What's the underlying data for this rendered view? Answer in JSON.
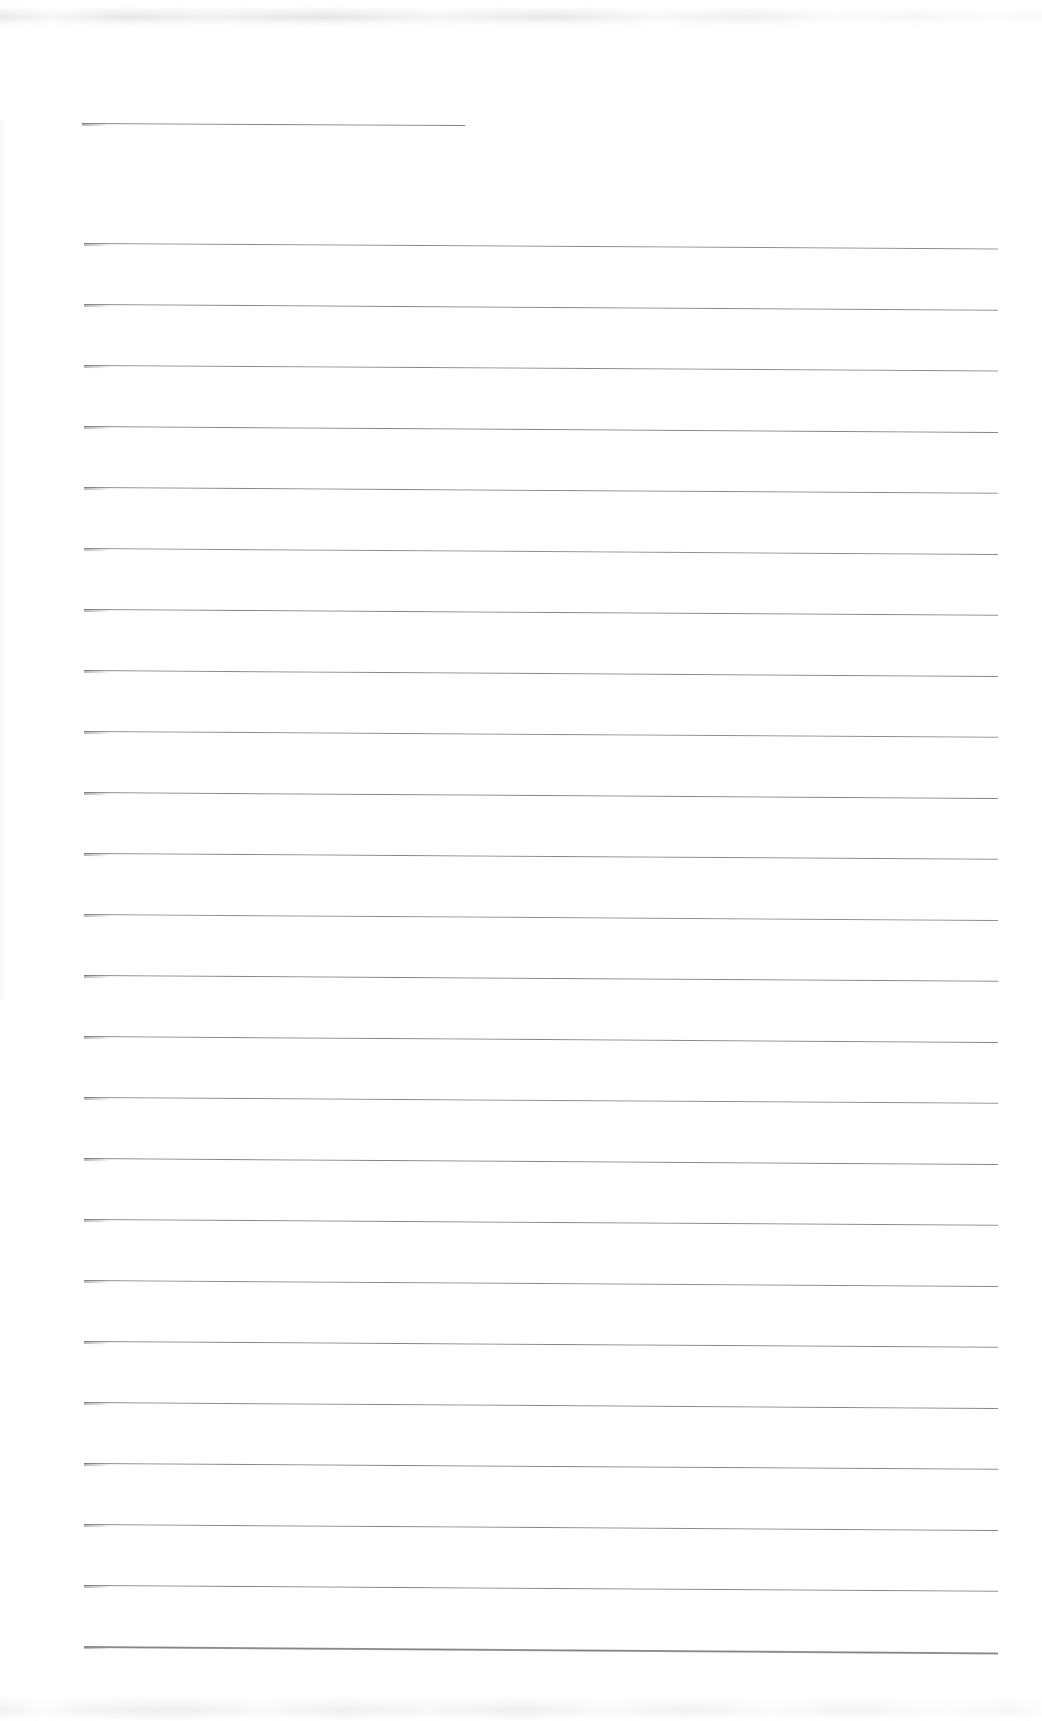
{
  "document": {
    "kind": "scanned-lined-paper",
    "title": "Blank Ruled Notebook Page",
    "page_width": 1042,
    "page_height": 1721,
    "background_color": "#ffffff",
    "rule_color": "#8f9196",
    "content_text": "",
    "handwriting": "",
    "typed_text": "",
    "header_text": "",
    "footer_text": "",
    "page_number": "",
    "notes": "No text, figures, captions, or marks are present on the page; the sheet is entirely blank apart from the printed horizontal ruling lines and faint scanner edge smudges."
  },
  "layout": {
    "rule_left_x": 84,
    "rule_right_x": 998,
    "header_rule_left_x": 82,
    "header_rule_right_x": 465,
    "first_rule_y": 123,
    "body_first_rule_y": 243,
    "body_last_rule_y": 1646,
    "rule_spacing": 61,
    "rule_thickness": 1.4,
    "skew_degrees": 0.38
  },
  "rules": [
    {
      "id": "rule-header",
      "y": 123,
      "x": 82,
      "width": 383,
      "skew": 0.3,
      "weight": 1.4,
      "opacity": 0.95,
      "type": "header"
    },
    {
      "id": "rule-01",
      "y": 243,
      "x": 84,
      "width": 914,
      "skew": 0.34,
      "weight": 1.3,
      "opacity": 0.88,
      "type": "body"
    },
    {
      "id": "rule-02",
      "y": 304,
      "x": 84,
      "width": 914,
      "skew": 0.36,
      "weight": 1.3,
      "opacity": 0.9,
      "type": "body"
    },
    {
      "id": "rule-03",
      "y": 365,
      "x": 84,
      "width": 914,
      "skew": 0.34,
      "weight": 1.3,
      "opacity": 0.88,
      "type": "body"
    },
    {
      "id": "rule-04",
      "y": 426,
      "x": 84,
      "width": 914,
      "skew": 0.38,
      "weight": 1.3,
      "opacity": 0.92,
      "type": "body"
    },
    {
      "id": "rule-05",
      "y": 487,
      "x": 84,
      "width": 914,
      "skew": 0.36,
      "weight": 1.3,
      "opacity": 0.9,
      "type": "body"
    },
    {
      "id": "rule-06",
      "y": 548,
      "x": 84,
      "width": 914,
      "skew": 0.38,
      "weight": 1.3,
      "opacity": 0.86,
      "type": "body"
    },
    {
      "id": "rule-07",
      "y": 609,
      "x": 84,
      "width": 914,
      "skew": 0.36,
      "weight": 1.3,
      "opacity": 0.92,
      "type": "body"
    },
    {
      "id": "rule-08",
      "y": 670,
      "x": 84,
      "width": 914,
      "skew": 0.38,
      "weight": 1.3,
      "opacity": 0.9,
      "type": "body"
    },
    {
      "id": "rule-09",
      "y": 731,
      "x": 84,
      "width": 914,
      "skew": 0.36,
      "weight": 1.3,
      "opacity": 0.88,
      "type": "body"
    },
    {
      "id": "rule-10",
      "y": 792,
      "x": 84,
      "width": 914,
      "skew": 0.38,
      "weight": 1.3,
      "opacity": 0.92,
      "type": "body"
    },
    {
      "id": "rule-11",
      "y": 853,
      "x": 84,
      "width": 914,
      "skew": 0.36,
      "weight": 1.3,
      "opacity": 0.9,
      "type": "body"
    },
    {
      "id": "rule-12",
      "y": 914,
      "x": 84,
      "width": 914,
      "skew": 0.38,
      "weight": 1.3,
      "opacity": 0.86,
      "type": "body"
    },
    {
      "id": "rule-13",
      "y": 975,
      "x": 84,
      "width": 914,
      "skew": 0.36,
      "weight": 1.3,
      "opacity": 0.92,
      "type": "body"
    },
    {
      "id": "rule-14",
      "y": 1036,
      "x": 84,
      "width": 914,
      "skew": 0.38,
      "weight": 1.3,
      "opacity": 0.9,
      "type": "body"
    },
    {
      "id": "rule-15",
      "y": 1097,
      "x": 84,
      "width": 914,
      "skew": 0.36,
      "weight": 1.3,
      "opacity": 0.88,
      "type": "body"
    },
    {
      "id": "rule-16",
      "y": 1158,
      "x": 84,
      "width": 914,
      "skew": 0.38,
      "weight": 1.3,
      "opacity": 0.92,
      "type": "body"
    },
    {
      "id": "rule-17",
      "y": 1219,
      "x": 84,
      "width": 914,
      "skew": 0.36,
      "weight": 1.3,
      "opacity": 0.9,
      "type": "body"
    },
    {
      "id": "rule-18",
      "y": 1280,
      "x": 84,
      "width": 914,
      "skew": 0.38,
      "weight": 1.3,
      "opacity": 0.88,
      "type": "body"
    },
    {
      "id": "rule-19",
      "y": 1341,
      "x": 84,
      "width": 914,
      "skew": 0.36,
      "weight": 1.3,
      "opacity": 0.92,
      "type": "body"
    },
    {
      "id": "rule-20",
      "y": 1402,
      "x": 84,
      "width": 914,
      "skew": 0.38,
      "weight": 1.4,
      "opacity": 0.9,
      "type": "body"
    },
    {
      "id": "rule-21",
      "y": 1463,
      "x": 84,
      "width": 914,
      "skew": 0.36,
      "weight": 1.4,
      "opacity": 0.92,
      "type": "body"
    },
    {
      "id": "rule-22",
      "y": 1524,
      "x": 84,
      "width": 914,
      "skew": 0.38,
      "weight": 1.4,
      "opacity": 0.9,
      "type": "body"
    },
    {
      "id": "rule-23",
      "y": 1585,
      "x": 84,
      "width": 914,
      "skew": 0.36,
      "weight": 1.4,
      "opacity": 0.92,
      "type": "body"
    },
    {
      "id": "rule-24",
      "y": 1646,
      "x": 84,
      "width": 914,
      "skew": 0.4,
      "weight": 1.5,
      "opacity": 0.94,
      "type": "body"
    }
  ],
  "artifacts": {
    "top_band_label": "scanner-edge-smudge-top",
    "bottom_band_label": "scanner-edge-smudge-bottom",
    "left_edge_label": "scanner-edge-shadow-left"
  }
}
